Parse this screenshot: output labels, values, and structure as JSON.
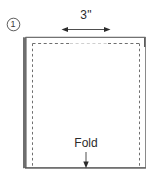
{
  "figure": {
    "background_color": "#ffffff",
    "width": 163,
    "height": 178
  },
  "step_marker": {
    "name": "circled-step-number",
    "number": "1",
    "shape": "circle-outline"
  },
  "dimension": {
    "label": "3\"",
    "value": 3,
    "unit": "inches",
    "arrow_style": "double-headed",
    "orientation": "horizontal"
  },
  "fold": {
    "label": "Fold",
    "arrow_style": "single-headed",
    "direction": "down"
  },
  "shapes": {
    "outer_rectangle": {
      "name": "fabric-panel",
      "stroke": "#8a8a8a",
      "fill": "#ffffff"
    },
    "edge_shadow": {
      "name": "fabric-left-edge-shadow",
      "color": "#555555"
    },
    "inner_dashed": {
      "name": "stitch-line",
      "stroke": "#6e6e6e",
      "style": "dashed"
    }
  },
  "colors": {
    "line": "#8a8a8a",
    "dark_line": "#3a3a3a",
    "dash": "#6e6e6e",
    "text": "#2b2b2b",
    "background": "#ffffff"
  }
}
